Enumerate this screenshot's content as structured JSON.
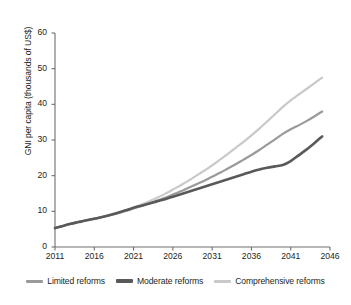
{
  "chart_data": {
    "type": "line",
    "title": "",
    "xlabel": "",
    "ylabel": "GNI per capita (thousands of US$)",
    "xlim": [
      2011,
      2046
    ],
    "ylim": [
      0,
      60
    ],
    "grid": false,
    "legend_position": "bottom",
    "x_ticks": [
      "2011",
      "2016",
      "2021",
      "2026",
      "2031",
      "2036",
      "2041",
      "2046"
    ],
    "y_ticks": [
      "0",
      "10",
      "20",
      "30",
      "40",
      "50",
      "60"
    ],
    "x": [
      2011,
      2012,
      2013,
      2014,
      2015,
      2016,
      2017,
      2018,
      2019,
      2020,
      2021,
      2022,
      2023,
      2024,
      2025,
      2026,
      2027,
      2028,
      2029,
      2030,
      2031,
      2032,
      2033,
      2034,
      2035,
      2036,
      2037,
      2038,
      2039,
      2040,
      2041,
      2042,
      2043,
      2044,
      2045
    ],
    "series": [
      {
        "name": "Limited reforms",
        "color": "#9a9a9a",
        "values": [
          5.3,
          5.9,
          6.5,
          7.0,
          7.5,
          7.9,
          8.4,
          8.9,
          9.5,
          10.1,
          10.8,
          11.5,
          12.2,
          13.0,
          13.8,
          14.7,
          15.6,
          16.6,
          17.6,
          18.6,
          19.7,
          20.8,
          22.0,
          23.2,
          24.5,
          25.8,
          27.2,
          28.7,
          30.2,
          31.7,
          33.0,
          34.1,
          35.3,
          36.6,
          38.0
        ]
      },
      {
        "name": "Moderate reforms",
        "color": "#58595b",
        "values": [
          5.3,
          5.9,
          6.5,
          7.0,
          7.5,
          7.9,
          8.4,
          9.0,
          9.6,
          10.3,
          11.0,
          11.6,
          12.2,
          12.8,
          13.4,
          14.1,
          14.8,
          15.5,
          16.2,
          16.9,
          17.6,
          18.3,
          19.0,
          19.7,
          20.4,
          21.1,
          21.7,
          22.2,
          22.6,
          23.0,
          24.1,
          25.7,
          27.3,
          29.1,
          31.0
        ]
      },
      {
        "name": "Comprehensive reforms",
        "color": "#c9c9c9",
        "values": [
          5.3,
          5.9,
          6.5,
          7.0,
          7.5,
          7.9,
          8.4,
          8.9,
          9.5,
          10.2,
          11.0,
          11.9,
          12.8,
          13.8,
          14.9,
          16.1,
          17.3,
          18.6,
          20.0,
          21.4,
          22.9,
          24.5,
          26.1,
          27.8,
          29.5,
          31.3,
          33.2,
          35.2,
          37.2,
          39.3,
          41.1,
          42.7,
          44.3,
          45.9,
          47.5
        ]
      }
    ]
  },
  "legend": {
    "items": [
      {
        "label": "Limited reforms",
        "color": "#9a9a9a"
      },
      {
        "label": "Moderate reforms",
        "color": "#58595b"
      },
      {
        "label": "Comprehensive reforms",
        "color": "#c9c9c9"
      }
    ]
  },
  "axes": {
    "y_label": "GNI per capita (thousands of US$)",
    "axis_color": "#6d6e71"
  }
}
